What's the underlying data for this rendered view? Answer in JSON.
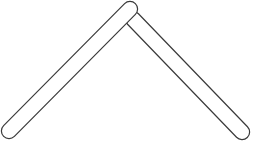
{
  "figure": {
    "title": "chevron-shape",
    "description": "Two rounded-end bars joined at an apex forming an inverted V (chevron / boomerang) outline",
    "canvas": {
      "width": 253,
      "height": 150,
      "background_color": "#ffffff"
    },
    "style": {
      "stroke_color": "#3a3a3a",
      "stroke_width": 1.2,
      "fill_color": "#ffffff",
      "line_cap": "round",
      "line_join": "round",
      "bar_thickness": 14
    },
    "bars": [
      {
        "name": "left-arm",
        "start_x": 9,
        "start_y": 131,
        "end_x": 130,
        "end_y": 9,
        "thickness": 14,
        "cap": "round"
      },
      {
        "name": "right-arm",
        "start_x": 133,
        "start_y": 19,
        "end_x": 242,
        "end_y": 132,
        "thickness": 14,
        "cap": "round"
      }
    ],
    "apex": {
      "x": 131,
      "y": 10,
      "label": "apex-joint"
    }
  }
}
